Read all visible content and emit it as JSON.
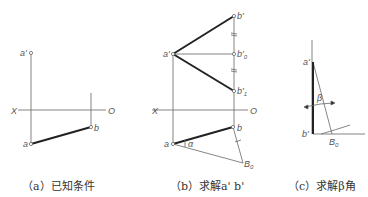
{
  "panels": [
    {
      "caption": "（a）已知条件",
      "labels": {
        "a_prime": "a'",
        "b": "b",
        "a": "a",
        "X": "X",
        "O": "O"
      }
    },
    {
      "caption": "（b）求解a' b'",
      "labels": {
        "b_prime": "b'",
        "b0_prime": "b'",
        "b0_sub": "0",
        "b1_prime": "b'",
        "b1_sub": "1",
        "a_prime": "a'",
        "X": "X",
        "O": "O",
        "b": "b",
        "a": "a",
        "alpha": "α",
        "B0": "B",
        "B0_sub": "0"
      }
    },
    {
      "caption": "（c）求解β角",
      "labels": {
        "a_prime": "a'",
        "beta": "β",
        "b_prime": "b'",
        "B0": "B",
        "B0_sub": "0"
      }
    }
  ],
  "colors": {
    "line": "#666666",
    "thick": "#222222"
  }
}
